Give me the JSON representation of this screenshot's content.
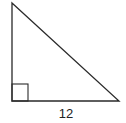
{
  "diagram": {
    "type": "right-triangle",
    "vertices": {
      "top": [
        12,
        3
      ],
      "right_angle": [
        12,
        101
      ],
      "bottom_right": [
        119,
        101
      ]
    },
    "right_angle_marker": {
      "x": 12,
      "y": 84,
      "size": 16
    },
    "labels": {
      "base": "12"
    },
    "colors": {
      "stroke": "#2a2a2a",
      "background": "#ffffff",
      "text": "#222222"
    }
  }
}
